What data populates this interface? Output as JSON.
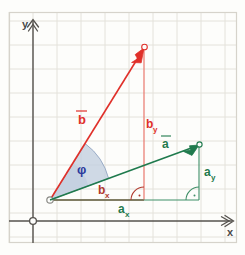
{
  "figure": {
    "background_color": "#fdfdfb",
    "border_color": "#d8d5cc",
    "grid_color": "#e3e1da",
    "axis_color": "#4a4a48"
  },
  "axes": {
    "x_label": "x",
    "y_label": "y",
    "origin_marker": "open-circle",
    "x_arrow": "double-chevron-right",
    "y_arrow": "double-chevron-up",
    "origin_px": {
      "x": 33,
      "y": 221
    },
    "grid_spacing_px": 24
  },
  "vectors": [
    {
      "id": "b",
      "label": "b⃗",
      "label_text": "b",
      "color": "#e0302a",
      "start_px": {
        "x": 50,
        "y": 200
      },
      "tip_px": {
        "x": 144,
        "y": 48
      },
      "components": {
        "x_label": "b",
        "x_sub": "x",
        "y_label": "b",
        "y_sub": "y",
        "x_color": "#c0392b",
        "y_color": "#e0302a"
      }
    },
    {
      "id": "a",
      "label": "a⃗",
      "label_text": "a",
      "color": "#1f7a4d",
      "start_px": {
        "x": 50,
        "y": 200
      },
      "tip_px": {
        "x": 199,
        "y": 145
      },
      "components": {
        "x_label": "a",
        "x_sub": "x",
        "y_label": "a",
        "y_sub": "y",
        "x_color": "#1f7a4d",
        "y_color": "#1f7a4d"
      }
    }
  ],
  "angle": {
    "symbol": "φ",
    "color": "#2b3a9c",
    "sector_fill": "#c3cfe0",
    "sector_stroke": "#8ea4c0",
    "radius_px": 62,
    "between": [
      "a",
      "b"
    ]
  },
  "right_angles": [
    {
      "for": "b",
      "color": "#c0392b",
      "at_px": {
        "x": 144,
        "y": 200
      }
    },
    {
      "for": "a",
      "color": "#1f7a4d",
      "at_px": {
        "x": 199,
        "y": 200
      }
    }
  ],
  "labels": {
    "vector_b": "b",
    "vector_a": "a",
    "b_x": "b",
    "b_x_sub": "x",
    "b_y": "b",
    "b_y_sub": "y",
    "a_x": "a",
    "a_x_sub": "x",
    "a_y": "a",
    "a_y_sub": "y",
    "phi": "φ",
    "axis_x": "x",
    "axis_y": "y"
  }
}
